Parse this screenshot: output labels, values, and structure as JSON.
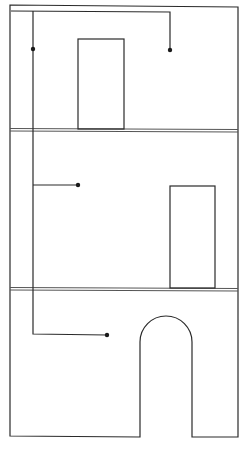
{
  "diagram": {
    "type": "building-section-piping",
    "colors": {
      "background": "#ffffff",
      "line": "#2a2a2a",
      "floor": "#555555",
      "node": "#1a1a1a"
    },
    "floors": [
      {
        "name": "floor-3",
        "door": "rectangular"
      },
      {
        "name": "floor-2",
        "door": "rectangular"
      },
      {
        "name": "floor-1",
        "door": "arched"
      }
    ],
    "pipe": {
      "riser": "vertical",
      "outlets": 4
    }
  }
}
